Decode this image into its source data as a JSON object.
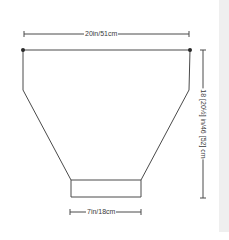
{
  "diagram": {
    "type": "knitting-schematic",
    "shape": "garment piece (trapezoid with straight upper sides and narrow bottom band)",
    "dimensions": {
      "top_width": "20in/51cm",
      "bottom_width": "7in/18cm",
      "height": "18 [20½] in/46 [52] cm"
    },
    "colors": {
      "line": "#4a4a4a",
      "background": "#ffffff",
      "side_strip": "#efefef"
    }
  }
}
